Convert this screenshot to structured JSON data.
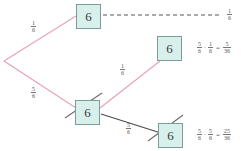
{
  "diagram": {
    "colors": {
      "branch_pink": "#e8a0b4",
      "branch_dark": "#4a4a4a",
      "dashed": "#555555",
      "box_fill": "#d8f0ec",
      "box_border": "#7f9a9a",
      "strike": "#6b6b6b",
      "text": "#555555"
    },
    "nodes": [
      {
        "id": "node-top",
        "label": "6",
        "struck": false,
        "x": 76,
        "y": 4
      },
      {
        "id": "node-middle",
        "label": "6",
        "struck": false,
        "x": 157,
        "y": 36
      },
      {
        "id": "node-lower-left",
        "label": "6",
        "struck": true,
        "x": 75,
        "y": 100
      },
      {
        "id": "node-lower-right",
        "label": "6",
        "struck": true,
        "x": 158,
        "y": 123
      }
    ],
    "edge_labels": [
      {
        "id": "label-upper-branch",
        "num": "1",
        "den": "6",
        "x": 31,
        "y": 20
      },
      {
        "id": "label-lower-branch",
        "num": "5",
        "den": "6",
        "x": 31,
        "y": 86
      },
      {
        "id": "label-middle-branch",
        "num": "1",
        "den": "6",
        "x": 120,
        "y": 63
      },
      {
        "id": "label-bottom-branch",
        "num": "5",
        "den": "6",
        "x": 126,
        "y": 122
      },
      {
        "id": "label-dashed-result",
        "num": "1",
        "den": "6",
        "x": 227,
        "y": 8
      }
    ],
    "equations": [
      {
        "id": "equation-top",
        "x": 196,
        "y": 41,
        "left": {
          "num": "5",
          "den": "6"
        },
        "op": "·",
        "right": {
          "num": "1",
          "den": "6"
        },
        "eq": "=",
        "result": {
          "num": "5",
          "den": "36"
        }
      },
      {
        "id": "equation-bottom",
        "x": 196,
        "y": 128,
        "left": {
          "num": "5",
          "den": "6"
        },
        "op": "·",
        "right": {
          "num": "5",
          "den": "6"
        },
        "eq": "=",
        "result": {
          "num": "25",
          "den": "36"
        }
      }
    ]
  }
}
